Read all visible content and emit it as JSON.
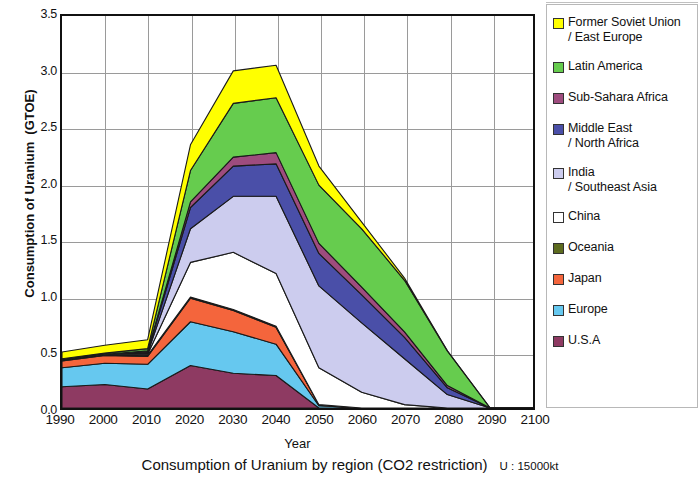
{
  "caption": {
    "title": "Consumption of Uranium by region (CO2 restriction)",
    "unit_note": "U : 15000kt",
    "smudge": ""
  },
  "axes": {
    "ylabel_text": "Consumption of Uranium",
    "ylabel_unit": "(GTOE)",
    "xlabel": "Year",
    "yticks": [
      "0.0",
      "0.5",
      "1.0",
      "1.5",
      "2.0",
      "2.5",
      "3.0",
      "3.5"
    ],
    "xticks": [
      "1990",
      "2000",
      "2010",
      "2020",
      "2030",
      "2040",
      "2050",
      "2060",
      "2070",
      "2080",
      "2090",
      "2100"
    ]
  },
  "legend": {
    "items": [
      {
        "label": "Former Soviet Union\n/ East Europe",
        "color": "#ffff00"
      },
      {
        "label": "Latin America",
        "color": "#66cc4e"
      },
      {
        "label": "Sub-Sahara Africa",
        "color": "#9e4c7e"
      },
      {
        "label": "Middle East\n  / North Africa",
        "color": "#4a4fa8"
      },
      {
        "label": "India\n  / Southeast Asia",
        "color": "#ccccee"
      },
      {
        "label": "China",
        "color": "#ffffff"
      },
      {
        "label": "Oceania",
        "color": "#5d6b1f"
      },
      {
        "label": "Japan",
        "color": "#f4653c"
      },
      {
        "label": "Europe",
        "color": "#66c8ef"
      },
      {
        "label": "U.S.A",
        "color": "#8e3a62"
      }
    ]
  },
  "chart_data": {
    "type": "area",
    "stacked": true,
    "title": "Consumption of Uranium by region (CO2 restriction)",
    "xlabel": "Year",
    "ylabel": "Consumption of Uranium (GTOE)",
    "unit_note": "U : 15000kt",
    "x": [
      1990,
      2000,
      2010,
      2020,
      2030,
      2040,
      2050,
      2060,
      2070,
      2080,
      2090,
      2100
    ],
    "ylim": [
      0.0,
      3.5
    ],
    "xlim": [
      1990,
      2100
    ],
    "ytick_step": 0.5,
    "grid": true,
    "legend_position": "right",
    "series": [
      {
        "name": "U.S.A",
        "color": "#8e3a62",
        "values": [
          0.19,
          0.21,
          0.17,
          0.38,
          0.31,
          0.29,
          0.0,
          0.0,
          0.0,
          0.0,
          0.0,
          0.0
        ]
      },
      {
        "name": "Europe",
        "color": "#66c8ef",
        "values": [
          0.17,
          0.19,
          0.22,
          0.39,
          0.37,
          0.28,
          0.02,
          0.0,
          0.0,
          0.0,
          0.0,
          0.0
        ]
      },
      {
        "name": "Japan",
        "color": "#f4653c",
        "values": [
          0.06,
          0.07,
          0.07,
          0.21,
          0.19,
          0.15,
          0.01,
          0.0,
          0.0,
          0.0,
          0.0,
          0.0
        ]
      },
      {
        "name": "Oceania",
        "color": "#5d6b1f",
        "values": [
          0.01,
          0.01,
          0.01,
          0.01,
          0.01,
          0.01,
          0.0,
          0.0,
          0.0,
          0.0,
          0.0,
          0.0
        ]
      },
      {
        "name": "China",
        "color": "#ffffff",
        "values": [
          0.0,
          0.0,
          0.01,
          0.31,
          0.51,
          0.47,
          0.33,
          0.14,
          0.03,
          0.0,
          0.0,
          0.0
        ]
      },
      {
        "name": "India / Southeast Asia",
        "color": "#ccccee",
        "values": [
          0.0,
          0.0,
          0.01,
          0.3,
          0.5,
          0.69,
          0.73,
          0.62,
          0.41,
          0.12,
          0.0,
          0.0
        ]
      },
      {
        "name": "Middle East / North Africa",
        "color": "#4a4fa8",
        "values": [
          0.0,
          0.0,
          0.01,
          0.19,
          0.27,
          0.29,
          0.29,
          0.25,
          0.19,
          0.06,
          0.0,
          0.0
        ]
      },
      {
        "name": "Sub-Sahara Africa",
        "color": "#9e4c7e",
        "values": [
          0.0,
          0.0,
          0.01,
          0.05,
          0.08,
          0.1,
          0.09,
          0.07,
          0.05,
          0.02,
          0.0,
          0.0
        ]
      },
      {
        "name": "Latin America",
        "color": "#66cc4e",
        "values": [
          0.01,
          0.01,
          0.02,
          0.28,
          0.48,
          0.49,
          0.52,
          0.52,
          0.46,
          0.31,
          0.0,
          0.0
        ]
      },
      {
        "name": "Former Soviet Union / East Europe",
        "color": "#ffff00",
        "values": [
          0.06,
          0.07,
          0.08,
          0.23,
          0.29,
          0.29,
          0.17,
          0.06,
          0.02,
          0.0,
          0.0,
          0.0
        ]
      }
    ],
    "totals": [
      0.5,
      0.56,
      0.61,
      2.35,
      3.01,
      3.06,
      2.16,
      1.66,
      1.16,
      0.51,
      0.0,
      0.0
    ]
  }
}
